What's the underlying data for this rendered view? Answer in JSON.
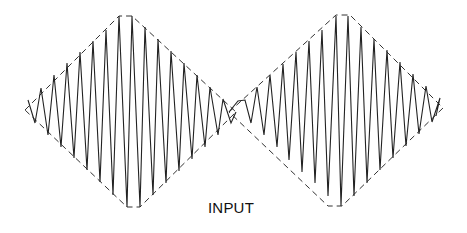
{
  "figure": {
    "label": "INPUT",
    "colors": {
      "background": "#ffffff",
      "line": "#222222",
      "envelope": "#333333"
    }
  },
  "lobes": [
    {
      "name": "left-lobe",
      "envelope": [
        [
          25,
          110
        ],
        [
          119,
          16
        ],
        [
          132,
          16
        ],
        [
          236,
          112
        ],
        [
          140,
          207
        ],
        [
          127,
          207
        ],
        [
          25,
          110
        ]
      ],
      "carrier_points": [
        [
          28,
          100
        ],
        [
          35,
          123
        ],
        [
          41,
          88
        ],
        [
          48,
          135
        ],
        [
          54,
          75
        ],
        [
          61,
          147
        ],
        [
          67,
          63
        ],
        [
          74,
          158
        ],
        [
          80,
          52
        ],
        [
          87,
          170
        ],
        [
          93,
          41
        ],
        [
          100,
          182
        ],
        [
          106,
          30
        ],
        [
          113,
          195
        ],
        [
          119,
          16
        ],
        [
          127,
          207
        ],
        [
          132,
          16
        ],
        [
          140,
          207
        ],
        [
          145,
          27
        ],
        [
          153,
          195
        ],
        [
          158,
          39
        ],
        [
          166,
          183
        ],
        [
          171,
          51
        ],
        [
          179,
          171
        ],
        [
          184,
          63
        ],
        [
          192,
          159
        ],
        [
          197,
          75
        ],
        [
          205,
          147
        ],
        [
          210,
          87
        ],
        [
          218,
          135
        ],
        [
          223,
          99
        ],
        [
          231,
          123
        ],
        [
          236,
          112
        ]
      ]
    },
    {
      "name": "right-lobe",
      "envelope": [
        [
          229,
          112
        ],
        [
          336,
          15
        ],
        [
          350,
          15
        ],
        [
          443,
          108
        ],
        [
          342,
          206
        ],
        [
          328,
          206
        ],
        [
          229,
          112
        ]
      ],
      "carrier_points": [
        [
          229,
          112
        ],
        [
          238,
          101
        ],
        [
          245,
          100
        ],
        [
          251,
          123
        ],
        [
          257,
          87
        ],
        [
          264,
          135
        ],
        [
          270,
          75
        ],
        [
          277,
          147
        ],
        [
          283,
          64
        ],
        [
          289,
          160
        ],
        [
          296,
          52
        ],
        [
          302,
          172
        ],
        [
          309,
          41
        ],
        [
          315,
          183
        ],
        [
          322,
          30
        ],
        [
          328,
          196
        ],
        [
          336,
          16
        ],
        [
          341,
          206
        ],
        [
          348,
          16
        ],
        [
          354,
          196
        ],
        [
          361,
          27
        ],
        [
          367,
          183
        ],
        [
          374,
          39
        ],
        [
          380,
          170
        ],
        [
          387,
          50
        ],
        [
          393,
          158
        ],
        [
          400,
          62
        ],
        [
          406,
          146
        ],
        [
          413,
          74
        ],
        [
          419,
          134
        ],
        [
          426,
          86
        ],
        [
          432,
          122
        ],
        [
          440,
          98
        ],
        [
          436,
          116
        ]
      ]
    }
  ]
}
